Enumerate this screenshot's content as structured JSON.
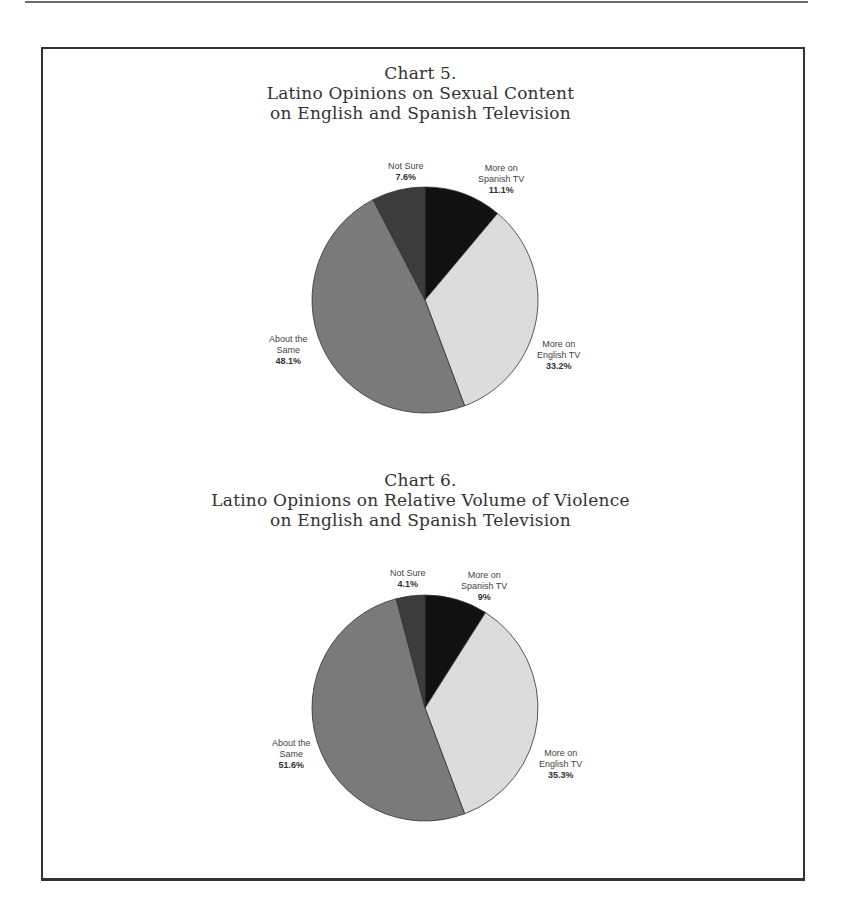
{
  "page": {
    "frame": true
  },
  "chart_data": [
    {
      "type": "pie",
      "title_line1": "Chart 5.",
      "title_line2": "Latino Opinions on Sexual Content",
      "title_line3": "on English and Spanish Television",
      "slices": [
        {
          "label": "More on Spanish TV",
          "label_lines": [
            "More on",
            "Spanish TV"
          ],
          "value": 11.1,
          "display": "11.1%",
          "color": "#111111"
        },
        {
          "label": "More on English TV",
          "label_lines": [
            "More on",
            "English TV"
          ],
          "value": 33.2,
          "display": "33.2%",
          "color": "#dcdcdc"
        },
        {
          "label": "About the Same",
          "label_lines": [
            "About the",
            "Same"
          ],
          "value": 48.1,
          "display": "48.1%",
          "color": "#7a7a7a"
        },
        {
          "label": "Not Sure",
          "label_lines": [
            "Not Sure"
          ],
          "value": 7.6,
          "display": "7.6%",
          "color": "#3c3c3c"
        }
      ]
    },
    {
      "type": "pie",
      "title_line1": "Chart 6.",
      "title_line2": "Latino Opinions on Relative Volume of Violence",
      "title_line3": "on English and Spanish Television",
      "slices": [
        {
          "label": "More on Spanish TV",
          "label_lines": [
            "More on",
            "Spanish TV"
          ],
          "value": 9,
          "display": "9%",
          "color": "#111111"
        },
        {
          "label": "More on English TV",
          "label_lines": [
            "More on",
            "English TV"
          ],
          "value": 35.3,
          "display": "35.3%",
          "color": "#dcdcdc"
        },
        {
          "label": "About the Same",
          "label_lines": [
            "About the",
            "Same"
          ],
          "value": 51.6,
          "display": "51.6%",
          "color": "#7a7a7a"
        },
        {
          "label": "Not Sure",
          "label_lines": [
            "Not Sure"
          ],
          "value": 4.1,
          "display": "4.1%",
          "color": "#3c3c3c"
        }
      ]
    }
  ]
}
